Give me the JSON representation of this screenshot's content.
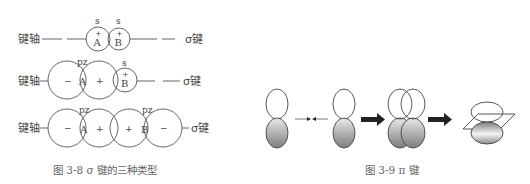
{
  "figure_left": {
    "caption": "图 3-8   σ 键的三种类型",
    "axis_label": "键轴",
    "bond_label": "σ键",
    "rows": [
      {
        "type": "s-s",
        "orbitals": [
          {
            "label": "s",
            "sign": "+",
            "atom": "A"
          },
          {
            "label": "s",
            "sign": "+",
            "atom": "B"
          }
        ]
      },
      {
        "type": "p-s",
        "orbitals": [
          {
            "label": "pz",
            "lobes": [
              "-",
              "+"
            ],
            "atom": "A"
          },
          {
            "label": "s",
            "sign": "+",
            "atom": "B"
          }
        ]
      },
      {
        "type": "p-p",
        "orbitals": [
          {
            "label": "pz",
            "lobes": [
              "-",
              "+"
            ],
            "atom": "A"
          },
          {
            "label": "pz",
            "lobes": [
              "+",
              "-"
            ],
            "atom": "B"
          }
        ]
      }
    ]
  },
  "figure_right": {
    "caption": "图 3-9   π 键",
    "stages": [
      "two separate p orbitals approaching",
      "side-by-side overlap",
      "π bond with nodal plane"
    ]
  },
  "labels": {
    "s": "s",
    "pz": "pz",
    "A": "A",
    "B": "B",
    "plus": "+",
    "minus": "−"
  },
  "colors": {
    "stroke": "#555555",
    "lobe_fill_dark": "#8a8a8a",
    "lobe_fill_light": "#f2f2f2",
    "arrow": "#222222"
  }
}
